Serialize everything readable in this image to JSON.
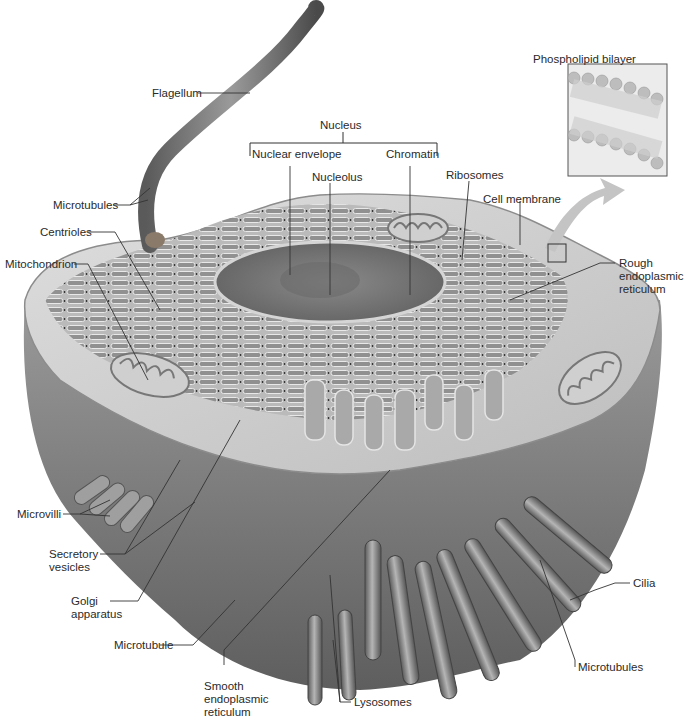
{
  "figure": {
    "inset": {
      "title": "Phospholipid bilayer"
    },
    "group_labels": {
      "nucleus": "Nucleus"
    },
    "labels": {
      "flagellum": "Flagellum",
      "microtubules_flagellum": "Microtubules",
      "centrioles": "Centrioles",
      "mitochondrion": "Mitochondrion",
      "nuclear_envelope": "Nuclear envelope",
      "nucleolus": "Nucleolus",
      "chromatin": "Chromatin",
      "ribosomes": "Ribosomes",
      "cell_membrane": "Cell membrane",
      "rough_er_1": "Rough",
      "rough_er_2": "endoplasmic",
      "rough_er_3": "reticulum",
      "microvilli": "Microvilli",
      "secretory_1": "Secretory",
      "secretory_2": "vesicles",
      "golgi_1": "Golgi",
      "golgi_2": "apparatus",
      "microtubule": "Microtubule",
      "smooth_er_1": "Smooth",
      "smooth_er_2": "endoplasmic",
      "smooth_er_3": "reticulum",
      "lysosomes": "Lysosomes",
      "cilia": "Cilia",
      "microtubules_cilia": "Microtubules"
    },
    "colors": {
      "background": "#ffffff",
      "label_text": "#2a2a2a",
      "leader_line": "#333333",
      "cytoplasm_light": "#d9d9d9",
      "cytoplasm_mid": "#a8a8a8",
      "cell_dark": "#6e6e6e",
      "nucleus": "#7a7a7a",
      "inset_bg": "#ececec"
    }
  }
}
